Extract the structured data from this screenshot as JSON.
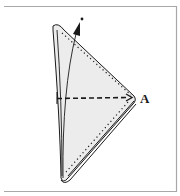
{
  "diagram": {
    "labels": {
      "point_a": "A"
    },
    "colors": {
      "paper_fill": "#ececec",
      "line": "#1a1a1a",
      "frame": "#a8a8a8",
      "background": "#ffffff"
    },
    "elements": [
      "folded triangular napkin",
      "dashed fold arrow toward point A",
      "curved arrow pointing up to dot",
      "dotted stitching edge lines"
    ]
  }
}
